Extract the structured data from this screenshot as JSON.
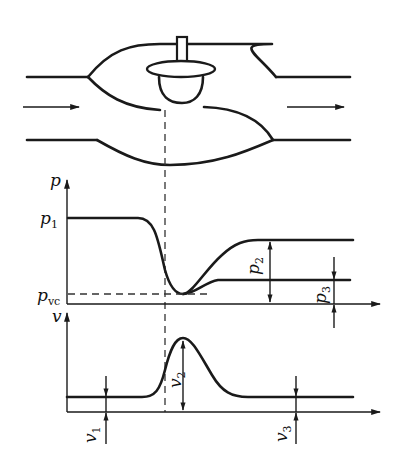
{
  "figure": {
    "valve": {
      "flow_direction_icons": [
        "arrow-right",
        "arrow-right"
      ]
    },
    "pressure_chart": {
      "y_axis_label": "p",
      "labels": {
        "p1": {
          "main": "p",
          "sub": "1"
        },
        "pvc": {
          "main": "p",
          "sub": "vc"
        },
        "p2": {
          "main": "p",
          "sub": "2"
        },
        "p3": {
          "main": "p",
          "sub": "3"
        }
      }
    },
    "velocity_chart": {
      "y_axis_label": "v",
      "labels": {
        "v1": {
          "main": "v",
          "sub": "1"
        },
        "v2": {
          "main": "v",
          "sub": "2"
        },
        "v3": {
          "main": "v",
          "sub": "3"
        }
      }
    }
  },
  "colors": {
    "line": "#1a1a1a",
    "background": "#ffffff"
  }
}
